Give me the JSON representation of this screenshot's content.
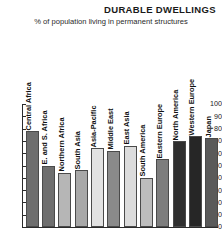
{
  "header": {
    "title": "DURABLE DWELLINGS",
    "subtitle": "% of population living in permanent structures"
  },
  "chart_data": {
    "type": "bar",
    "title": "DURABLE DWELLINGS",
    "subtitle": "% of population living in permanent structures",
    "xlabel": "",
    "ylabel": "",
    "ylim": [
      0,
      100
    ],
    "yticks": [
      100,
      90,
      80,
      70,
      60,
      50,
      40,
      30,
      20,
      10,
      0
    ],
    "grid": false,
    "legend": "none",
    "categories": [
      "Central Africa",
      "E. and S. Africa",
      "Northern Africa",
      "South Asia",
      "Asia-Pacific",
      "Middle East",
      "East Asia",
      "South America",
      "Eastern Europe",
      "North America",
      "Western Europe",
      "Japan"
    ],
    "values": [
      78,
      50,
      44,
      46,
      64,
      62,
      66,
      40,
      55,
      70,
      74,
      72
    ],
    "colors": [
      "#6e6e6e",
      "#6e6e6e",
      "#b6b6b6",
      "#a8a8a8",
      "#e2e2e2",
      "#8a8a8a",
      "#dcdcdc",
      "#bdbdbd",
      "#7d7d7d",
      "#2f2f2f",
      "#262626",
      "#5a5a5a"
    ]
  }
}
